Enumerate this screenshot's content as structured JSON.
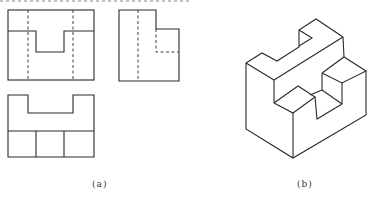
{
  "figure": {
    "panel_a": {
      "caption": "(a)",
      "views": [
        "front-view",
        "side-view",
        "top-view"
      ]
    },
    "panel_b": {
      "caption": "(b)",
      "views": [
        "isometric-view"
      ]
    }
  },
  "colors": {
    "line": "#2a2a2a",
    "background": "#ffffff"
  }
}
